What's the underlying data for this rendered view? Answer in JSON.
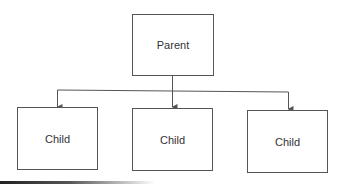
{
  "diagram": {
    "type": "hierarchy",
    "nodes": {
      "parent": {
        "label": "Parent"
      },
      "child_left": {
        "label": "Child"
      },
      "child_middle": {
        "label": "Child"
      },
      "child_right": {
        "label": "Child"
      }
    },
    "edges": [
      {
        "from": "Parent",
        "to": "Child (left)"
      },
      {
        "from": "Parent",
        "to": "Child (middle)"
      },
      {
        "from": "Parent",
        "to": "Child (right)"
      }
    ],
    "colors": {
      "line": "#555555",
      "text": "#333333",
      "background": "#ffffff"
    }
  }
}
